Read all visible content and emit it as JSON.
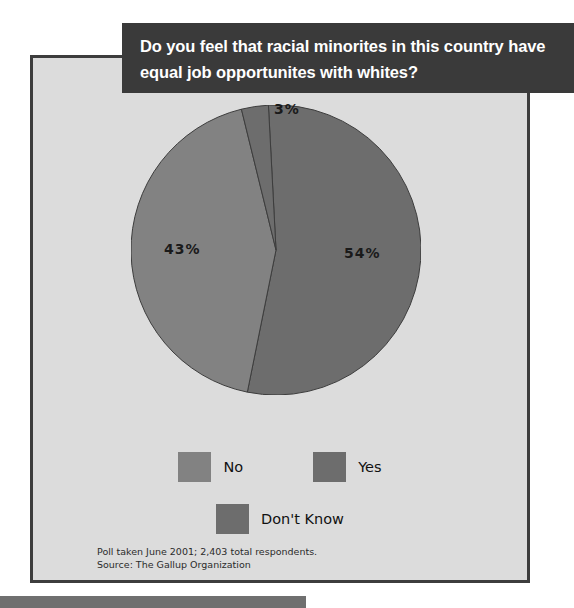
{
  "title": {
    "line1": "Do you feel that racial minorites in this country have",
    "line2": "equal job opportunites with whites?",
    "background_color": "#3a3a3a",
    "text_color": "#ffffff"
  },
  "panel": {
    "background_color": "#dcdcdc",
    "border_color": "#3d3d3d"
  },
  "labels": {
    "yes": "54%",
    "no": "43%",
    "dont_know": "3%"
  },
  "legend": {
    "no": "No",
    "yes": "Yes",
    "dont_know": "Don't Know"
  },
  "source": {
    "line1": "Poll taken June 2001; 2,403 total respondents.",
    "line2": "Source: The Gallup Organization"
  },
  "chart_data": {
    "type": "pie",
    "title": "Do you feel that racial minorites in this country have equal job opportunites with whites?",
    "categories": [
      "Yes",
      "No",
      "Don't Know"
    ],
    "values": [
      54,
      43,
      3
    ],
    "value_labels": [
      "54%",
      "43%",
      "3%"
    ],
    "unit": "percent",
    "colors": [
      "#6d6d6d",
      "#828282",
      "#6d6d6d"
    ],
    "legend_position": "bottom",
    "legend_order": [
      "No",
      "Yes",
      "Don't Know"
    ],
    "grid": false,
    "start_angle_deg": -3,
    "direction": "clockwise",
    "annotations": [
      "Poll taken June 2001; 2,403 total respondents.",
      "Source: The Gallup Organization"
    ],
    "total_respondents": 2403,
    "poll_date": "June 2001",
    "source": "The Gallup Organization"
  }
}
